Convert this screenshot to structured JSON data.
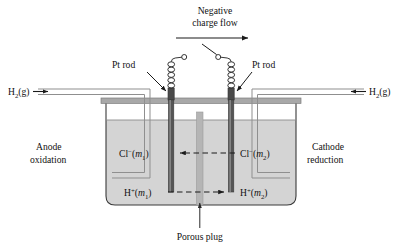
{
  "figure": {
    "title": "Negative charge flow",
    "title_line1": "Negative",
    "title_line2": "charge flow"
  },
  "colors": {
    "outline": "#3a3a3a",
    "electrode": "#4d4d4d",
    "electrode_dark": "#3f3f3f",
    "solution": "#d4d4d4",
    "headspace": "#ffffff",
    "rim": "#a8a8a8",
    "plug": "#b5b5b5",
    "tube": "#9a9a9a",
    "text": "#111111",
    "arrow": "#1a1a1a"
  },
  "electrodes": {
    "left_label": "Pt rod",
    "right_label": "Pt rod"
  },
  "gas_inlets": {
    "left": {
      "formula": "H",
      "subscript": "2",
      "state": "(g)",
      "full_label": "H2(g)",
      "arrow_direction": "right"
    },
    "right": {
      "formula": "H",
      "subscript": "2",
      "state": "(g)",
      "full_label": "H2(g)",
      "arrow_direction": "left"
    }
  },
  "sides": {
    "left": {
      "name_line1": "Anode",
      "name_line2": "oxidation"
    },
    "right": {
      "name_line1": "Cathode",
      "name_line2": "reduction"
    }
  },
  "ions": {
    "chloride_left": {
      "species": "Cl",
      "charge": "−",
      "molality": "m",
      "index": "1",
      "full_label": "Cl-(m1)"
    },
    "chloride_right": {
      "species": "Cl",
      "charge": "−",
      "molality": "m",
      "index": "2",
      "full_label": "Cl-(m2)"
    },
    "hydrogen_left": {
      "species": "H",
      "charge": "+",
      "molality": "m",
      "index": "1",
      "full_label": "H+(m1)"
    },
    "hydrogen_right": {
      "species": "H",
      "charge": "+",
      "molality": "m",
      "index": "2",
      "full_label": "H+(m2)"
    },
    "chloride_flow_direction": "left",
    "hydrogen_flow_direction": "right"
  },
  "plug": {
    "label": "Porous plug"
  }
}
